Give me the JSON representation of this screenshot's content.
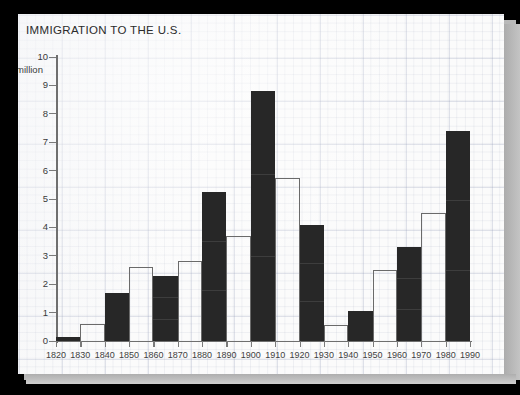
{
  "chart_data": {
    "type": "bar",
    "title": "IMMIGRATION TO THE U.S.",
    "xlabel": "",
    "ylabel": "million",
    "ylim": [
      0,
      10
    ],
    "ytick_labels": [
      "10",
      "9",
      "8",
      "7",
      "6",
      "5",
      "4",
      "3",
      "2",
      "1",
      "0"
    ],
    "ytick_values": [
      10,
      9,
      8,
      7,
      6,
      5,
      4,
      3,
      2,
      1,
      0
    ],
    "xtick_labels": [
      "1820",
      "1830",
      "1840",
      "1850",
      "1860",
      "1870",
      "1880",
      "1890",
      "1900",
      "1910",
      "1920",
      "1930",
      "1940",
      "1950",
      "1960",
      "1970",
      "1980",
      "1990"
    ],
    "grid": true,
    "legend": "none",
    "bar_fills": [
      "dark",
      "light",
      "dark",
      "light",
      "dark",
      "light",
      "dark",
      "light",
      "dark",
      "light",
      "dark",
      "light",
      "dark",
      "light",
      "dark",
      "light",
      "dark"
    ],
    "categories": [
      "1820-1830",
      "1830-1840",
      "1840-1850",
      "1850-1860",
      "1860-1870",
      "1870-1880",
      "1880-1890",
      "1890-1900",
      "1900-1910",
      "1910-1920",
      "1920-1930",
      "1930-1940",
      "1940-1950",
      "1950-1960",
      "1960-1970",
      "1970-1980",
      "1980-1990"
    ],
    "values": [
      0.15,
      0.6,
      1.7,
      2.6,
      2.3,
      2.8,
      5.25,
      3.7,
      8.8,
      5.75,
      4.1,
      0.55,
      1.05,
      2.5,
      3.3,
      4.5,
      7.4
    ]
  },
  "colors": {
    "bar_dark": "#272727",
    "bar_light_outline": "#6a6a6a",
    "paper": "#fbfbfb",
    "grid": "#8c96b4",
    "axis": "#6f6f6f",
    "backdrop": "#000000",
    "sheet_shadow": "#b9b9b9"
  }
}
